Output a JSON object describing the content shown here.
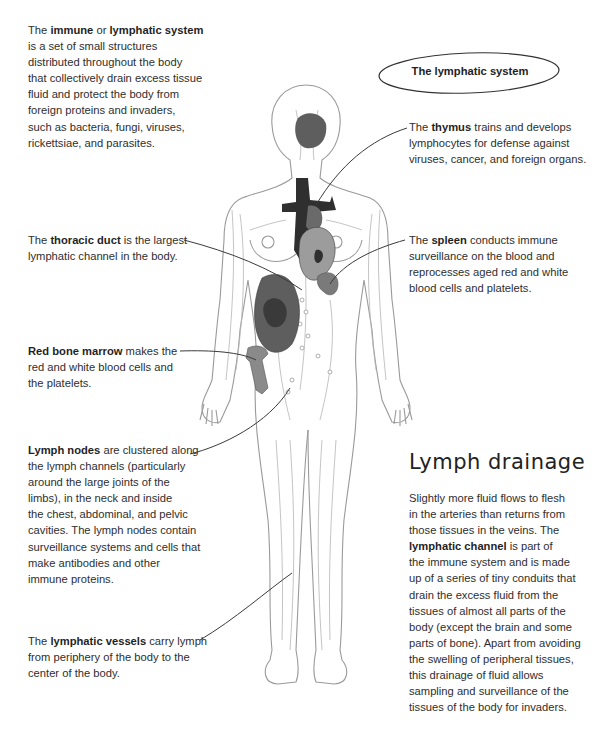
{
  "title_badge": {
    "label": "The lymphatic system"
  },
  "intro": {
    "pre": "The ",
    "bold1": "immune",
    "mid": " or ",
    "bold2": "lymphatic system",
    "lines": [
      "is a set of small structures",
      "distributed throughout the body",
      "that collectively drain excess tissue",
      "fluid and protect the body from",
      "foreign proteins and invaders,",
      "such as bacteria, fungi, viruses,",
      "rickettsiae, and parasites."
    ]
  },
  "callouts": {
    "thymus": {
      "pre": "The ",
      "bold": "thymus",
      "post": " trains and develops",
      "lines": [
        "lymphocytes for defense against",
        "viruses, cancer, and foreign organs."
      ]
    },
    "thoracic_duct": {
      "pre": "The ",
      "bold": "thoracic duct",
      "post": " is the largest",
      "lines": [
        "lymphatic channel in the body."
      ]
    },
    "spleen": {
      "pre": "The ",
      "bold": "spleen",
      "post": " conducts immune",
      "lines": [
        "surveillance on the blood and",
        "reprocesses aged red and white",
        "blood cells and platelets."
      ]
    },
    "bone_marrow": {
      "bold": "Red bone marrow",
      "post": " makes the",
      "lines": [
        "red and white blood cells and",
        "the platelets."
      ]
    },
    "lymph_nodes": {
      "bold": "Lymph nodes",
      "post": " are clustered along",
      "lines": [
        "the lymph channels (particularly",
        "around the large joints of the",
        "limbs), in the neck and inside",
        "the chest, abdominal, and pelvic",
        "cavities. The lymph nodes contain",
        "surveillance systems and cells that",
        "make antibodies and other",
        "immune proteins."
      ]
    },
    "lymphatic_vessels": {
      "pre": "The ",
      "bold": "lymphatic vessels",
      "post": " carry lymph",
      "lines": [
        "from periphery of the body to the",
        "center of the body."
      ]
    }
  },
  "drainage": {
    "heading": "Lymph drainage",
    "lines_before": [
      "Slightly more fluid flows to flesh",
      "in the arteries than returns from",
      "those tissues in the veins. The"
    ],
    "bold": "lymphatic channel",
    "bold_post": " is part of",
    "lines_after": [
      "the immune system and is made",
      "up of a series of tiny conduits that",
      "drain the excess fluid from the",
      "tissues of almost all parts of the",
      "body (except the brain and some",
      "parts of bone). Apart from avoiding",
      "the swelling of peripheral tissues,",
      "this drainage of fluid allows",
      "sampling and surveillance of the",
      "tissues of the body for invaders."
    ]
  },
  "colors": {
    "outline": "#9a9a9a",
    "vessel": "#b5b5b5",
    "dark_organ": "#2f2f2f",
    "mid_organ": "#5e5e5e",
    "light_organ": "#9c9c9c",
    "leader": "#3a3a3a"
  }
}
